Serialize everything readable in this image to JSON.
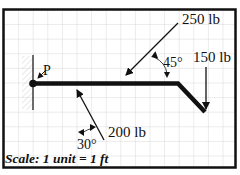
{
  "diagram": {
    "type": "free-body-diagram",
    "grid": {
      "spacing_px": 14.6,
      "color": "#cfcfcf"
    },
    "frame": {
      "color": "#111111"
    },
    "pivot": {
      "label": "P"
    },
    "forces": [
      {
        "id": "f250",
        "label": "250 lb",
        "angle_label": "45°"
      },
      {
        "id": "f150",
        "label": "150 lb"
      },
      {
        "id": "f200",
        "label": "200 lb",
        "angle_label": "30°"
      }
    ],
    "scale_text": "Scale: 1 unit = 1 ft"
  }
}
